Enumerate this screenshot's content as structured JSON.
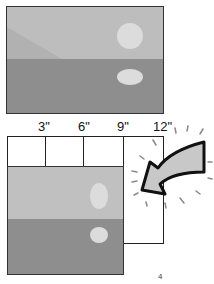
{
  "diagram": {
    "top_photo": {
      "description": "landscape photo with sun and reflection"
    },
    "ruler": {
      "labels": [
        "3\"",
        "6\"",
        "9\"",
        "12\""
      ]
    },
    "bottom_photo": {
      "description": "cropped portrait version of same photo"
    },
    "arrow": {
      "direction": "pointing down-left toward crop",
      "fill": "#c8c8c8"
    },
    "mark": "4"
  }
}
